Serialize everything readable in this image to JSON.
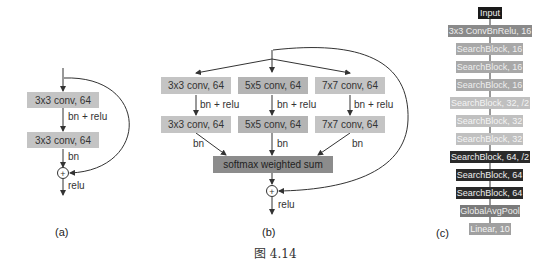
{
  "figure_caption": "图 4.14",
  "panel_a": {
    "caption": "(a)",
    "layers": [
      "3x3 conv, 64",
      "3x3 conv, 64"
    ],
    "edge_labels": [
      "bn + relu",
      "bn",
      "relu"
    ],
    "add_symbol": "+"
  },
  "panel_b": {
    "caption": "(b)",
    "branches": [
      {
        "top": "3x3 conv, 64",
        "bottom": "3x3 conv, 64",
        "mid_label": "bn + relu",
        "out_label": "bn"
      },
      {
        "top": "5x5 conv, 64",
        "bottom": "5x5 conv, 64",
        "mid_label": "bn + relu",
        "out_label": "bn"
      },
      {
        "top": "7x7 conv, 64",
        "bottom": "7x7 conv, 64",
        "mid_label": "bn + relu",
        "out_label": "bn"
      }
    ],
    "merge": "softmax weighted sum",
    "add_symbol": "+",
    "out_label": "relu"
  },
  "panel_c": {
    "caption": "(c)",
    "layers": [
      {
        "label": "Input",
        "color": "#1a1a1a"
      },
      {
        "label": "3x3 ConvBnRelu, 16",
        "color": "#8a8a8a"
      },
      {
        "label": "SearchBlock, 16",
        "color": "#a8a8a8"
      },
      {
        "label": "SearchBlock, 16",
        "color": "#a8a8a8"
      },
      {
        "label": "SearchBlock, 16",
        "color": "#a8a8a8"
      },
      {
        "label": "SearchBlock, 32, /2",
        "color": "#c0c0c0"
      },
      {
        "label": "SearchBlock, 32",
        "color": "#c0c0c0"
      },
      {
        "label": "SearchBlock, 32",
        "color": "#c0c0c0"
      },
      {
        "label": "SearchBlock, 64, /2",
        "color": "#2a2a2a"
      },
      {
        "label": "SearchBlock, 64",
        "color": "#2a2a2a"
      },
      {
        "label": "SearchBlock, 64",
        "color": "#2a2a2a"
      },
      {
        "label": "GlobalAvgPool",
        "color": "#7a7a7a"
      },
      {
        "label": "Linear, 10",
        "color": "#a0a0a0"
      }
    ]
  }
}
